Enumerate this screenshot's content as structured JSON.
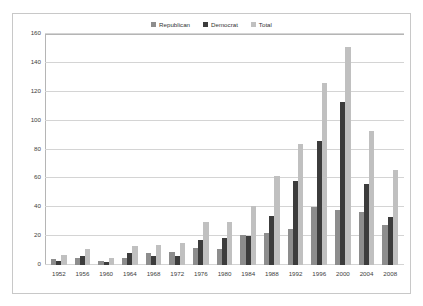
{
  "chart_data": {
    "type": "bar",
    "title": "",
    "xlabel": "",
    "ylabel": "",
    "ylim": [
      0,
      160
    ],
    "ytick_step": 20,
    "yticks": [
      160,
      140,
      120,
      100,
      80,
      60,
      40,
      20,
      0
    ],
    "grid": true,
    "legend_position": "top-center",
    "categories": [
      "1952",
      "1956",
      "1960",
      "1964",
      "1968",
      "1972",
      "1976",
      "1980",
      "1984",
      "1988",
      "1992",
      "1996",
      "2000",
      "2004",
      "2008"
    ],
    "series": [
      {
        "name": "Republican",
        "color": "#8d8d8d",
        "values": [
          4,
          5,
          3,
          5,
          8,
          9,
          12,
          11,
          21,
          22,
          25,
          40,
          38,
          37,
          28
        ]
      },
      {
        "name": "Democrat",
        "color": "#3c3c3c",
        "values": [
          3,
          6,
          2,
          8,
          6,
          6,
          17,
          19,
          20,
          34,
          58,
          86,
          113,
          56,
          33
        ]
      },
      {
        "name": "Total",
        "color": "#c0c0c0",
        "values": [
          7,
          11,
          5,
          13,
          14,
          15,
          30,
          30,
          41,
          62,
          84,
          126,
          151,
          93,
          66
        ]
      }
    ]
  }
}
